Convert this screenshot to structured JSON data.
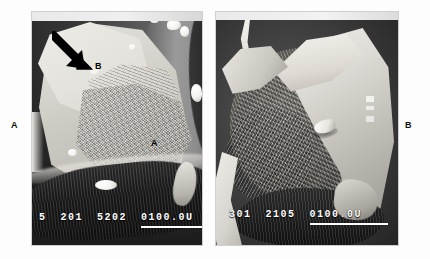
{
  "figure": {
    "type": "two-panel scanning electron micrograph",
    "panels": [
      {
        "outer_label": "A",
        "in_image_labels": [
          {
            "text": "B",
            "note": "upper smooth facet region"
          },
          {
            "text": "A",
            "note": "lower rough fracture region"
          }
        ],
        "arrow": {
          "name": "annotation-arrow",
          "direction": "down-right"
        },
        "overlay": {
          "field_1": "5",
          "field_2": "201",
          "field_3": "5202",
          "scale_text": "0100.0U"
        }
      },
      {
        "outer_label": "B",
        "in_image_labels": [],
        "overlay": {
          "field_1": "301",
          "field_2": "2105",
          "scale_text": "0100.0U"
        }
      }
    ]
  },
  "colors": {
    "page_background": "#ffffff",
    "overlay_text": "#ffffff",
    "label_text": "#111111",
    "frame_border": "#cfcfcf"
  }
}
